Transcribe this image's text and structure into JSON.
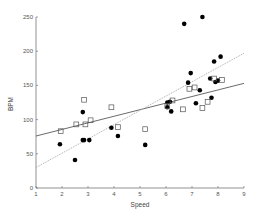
{
  "chart_data": {
    "type": "scatter",
    "title": "",
    "xlabel": "Speed",
    "ylabel": "BPM",
    "xlim": [
      1,
      9
    ],
    "ylim": [
      0,
      250
    ],
    "xticks": [
      1,
      2,
      3,
      4,
      5,
      6,
      7,
      8,
      9
    ],
    "yticks": [
      0,
      50,
      100,
      150,
      200,
      250
    ],
    "grid": false,
    "legend": null,
    "series": [
      {
        "name": "filled-circles",
        "marker": "circle-filled",
        "color": "#000000",
        "points": [
          [
            1.92,
            64
          ],
          [
            2.5,
            41
          ],
          [
            2.8,
            111
          ],
          [
            2.8,
            70
          ],
          [
            2.85,
            70
          ],
          [
            3.05,
            70
          ],
          [
            3.9,
            88
          ],
          [
            4.15,
            76
          ],
          [
            5.2,
            63
          ],
          [
            6.05,
            125
          ],
          [
            6.15,
            126
          ],
          [
            6.05,
            118
          ],
          [
            6.2,
            112
          ],
          [
            6.7,
            240
          ],
          [
            7.4,
            250
          ],
          [
            6.85,
            154
          ],
          [
            6.95,
            168
          ],
          [
            7.15,
            124
          ],
          [
            7.7,
            160
          ],
          [
            7.75,
            132
          ],
          [
            7.85,
            185
          ],
          [
            8.1,
            192
          ],
          [
            7.9,
            155
          ],
          [
            7.3,
            143
          ],
          [
            8.0,
            157
          ]
        ]
      },
      {
        "name": "open-squares",
        "marker": "square-open",
        "color": "#555555",
        "points": [
          [
            1.95,
            83
          ],
          [
            2.55,
            93
          ],
          [
            2.85,
            129
          ],
          [
            2.9,
            93
          ],
          [
            3.1,
            99
          ],
          [
            3.9,
            118
          ],
          [
            4.15,
            89
          ],
          [
            5.2,
            86
          ],
          [
            6.05,
            120
          ],
          [
            6.25,
            128
          ],
          [
            6.65,
            115
          ],
          [
            6.9,
            145
          ],
          [
            7.1,
            147
          ],
          [
            7.4,
            117
          ],
          [
            7.6,
            126
          ],
          [
            7.85,
            160
          ],
          [
            8.15,
            158
          ]
        ]
      }
    ],
    "fit_lines": [
      {
        "name": "solid-regression",
        "style": "solid",
        "color": "#444444",
        "from": [
          1,
          76
        ],
        "to": [
          9,
          153
        ]
      },
      {
        "name": "dotted-regression",
        "style": "dotted",
        "color": "#aaaaaa",
        "from": [
          1,
          30
        ],
        "to": [
          9,
          197
        ]
      }
    ]
  }
}
